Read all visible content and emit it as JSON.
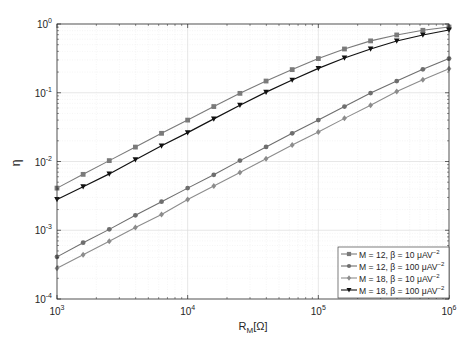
{
  "chart_data": {
    "type": "line",
    "title": "",
    "xlabel": "R_M[Ω]",
    "xlabel_main": "R",
    "xlabel_sub": "M",
    "xlabel_unit": "[Ω]",
    "ylabel": "η",
    "xscale": "log",
    "yscale": "log",
    "xlim": [
      1000,
      1000000
    ],
    "ylim": [
      0.0001,
      1
    ],
    "grid": true,
    "minor_grid": true,
    "legend_position": "lower right",
    "x_ticks": [
      {
        "base": "10",
        "exp": "3",
        "value": 1000
      },
      {
        "base": "10",
        "exp": "4",
        "value": 10000
      },
      {
        "base": "10",
        "exp": "5",
        "value": 100000
      },
      {
        "base": "10",
        "exp": "6",
        "value": 1000000
      }
    ],
    "y_ticks": [
      {
        "base": "10",
        "exp": "0",
        "value": 1
      },
      {
        "base": "10",
        "exp": "-1",
        "value": 0.1
      },
      {
        "base": "10",
        "exp": "-2",
        "value": 0.01
      },
      {
        "base": "10",
        "exp": "-3",
        "value": 0.001
      },
      {
        "base": "10",
        "exp": "-4",
        "value": 0.0001
      }
    ],
    "x": [
      1000,
      1585,
      2512,
      3981,
      6310,
      10000,
      15849,
      25119,
      39811,
      63096,
      100000,
      158489,
      251189,
      398107,
      630957,
      1000000
    ],
    "series": [
      {
        "name": "M = 12, β = 10 μAV⁻²",
        "label_main": "M = 12, β = 10 μAV",
        "label_exp": "−2",
        "color": "#7a7a7a",
        "marker": "square",
        "values": [
          0.0041,
          0.0065,
          0.0103,
          0.0162,
          0.0257,
          0.04,
          0.063,
          0.098,
          0.148,
          0.217,
          0.314,
          0.433,
          0.568,
          0.693,
          0.81,
          0.904
        ]
      },
      {
        "name": "M = 12, β = 100 μAV⁻²",
        "label_main": "M = 12, β = 100 μAV",
        "label_exp": "−2",
        "color": "#6e6e6e",
        "marker": "circle",
        "values": [
          0.00041,
          0.00066,
          0.00103,
          0.00165,
          0.0026,
          0.0041,
          0.0064,
          0.0103,
          0.0163,
          0.0257,
          0.04,
          0.063,
          0.099,
          0.148,
          0.219,
          0.314
        ]
      },
      {
        "name": "M = 18, β = 10 μAV⁻²",
        "label_main": "M = 18, β = 10 μAV",
        "label_exp": "−2",
        "color": "#8c8c8c",
        "marker": "diamond",
        "values": [
          0.00028,
          0.00044,
          0.00069,
          0.0011,
          0.0017,
          0.0028,
          0.0044,
          0.0069,
          0.011,
          0.0174,
          0.0269,
          0.0424,
          0.066,
          0.104,
          0.155,
          0.224
        ]
      },
      {
        "name": "M = 18, β = 100 μAV⁻²",
        "label_main": "M = 18, β = 100 μAV",
        "label_exp": "−2",
        "color": "#111111",
        "marker": "triangle-down",
        "values": [
          0.0028,
          0.0043,
          0.0066,
          0.0106,
          0.0169,
          0.0263,
          0.0417,
          0.066,
          0.102,
          0.153,
          0.226,
          0.32,
          0.433,
          0.566,
          0.692,
          0.818
        ]
      }
    ]
  },
  "colors": {
    "axis": "#262626",
    "grid_major": "#dcdcdc",
    "grid_minor": "#efefef",
    "legend_border": "#262626"
  }
}
